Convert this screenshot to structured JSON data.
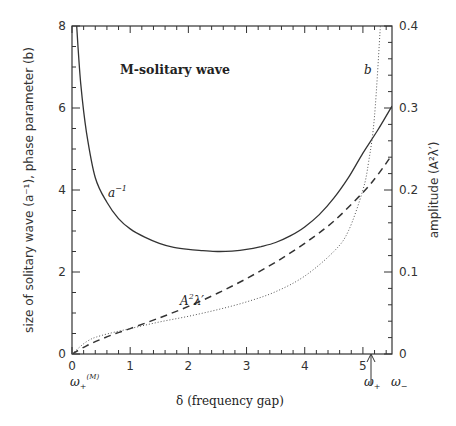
{
  "chart_data": {
    "type": "line",
    "title": "M-solitary wave",
    "xlabel": "δ (frequency gap)",
    "ylabel": "size of solitary wave (a⁻¹), phase parameter (b)",
    "y2label": "amplitude (A²λ′)",
    "xlim": [
      0,
      5.5
    ],
    "ylim": [
      0,
      8
    ],
    "y2lim": [
      0,
      0.4
    ],
    "xticks": [
      "0",
      "1",
      "2",
      "3",
      "4",
      "5"
    ],
    "yticks": [
      "0",
      "2",
      "4",
      "6",
      "8"
    ],
    "y2ticks": [
      "0",
      "0.1",
      "0.2",
      "0.3",
      "0.4"
    ],
    "grid": false,
    "legend": "inline labels",
    "annotations": [
      {
        "text": "ω₊⁽ᴹ⁾",
        "x": 0,
        "position": "below x-axis"
      },
      {
        "text": "ω₊",
        "x": 5.1,
        "position": "below x-axis with arrow"
      },
      {
        "text": "ω₋",
        "x": 5.5,
        "position": "below x-axis"
      }
    ],
    "series": [
      {
        "name": "a⁻¹",
        "style": "solid",
        "axis": "left",
        "x": [
          0.08,
          0.15,
          0.25,
          0.4,
          0.6,
          0.8,
          1.0,
          1.25,
          1.5,
          1.75,
          2.0,
          2.25,
          2.5,
          2.75,
          3.0,
          3.25,
          3.5,
          3.75,
          4.0,
          4.25,
          4.5,
          4.75,
          5.0,
          5.25,
          5.5
        ],
        "values": [
          8.0,
          6.6,
          5.4,
          4.3,
          3.7,
          3.3,
          3.05,
          2.85,
          2.7,
          2.6,
          2.55,
          2.52,
          2.5,
          2.51,
          2.55,
          2.62,
          2.72,
          2.88,
          3.1,
          3.4,
          3.8,
          4.3,
          4.9,
          5.45,
          6.05
        ]
      },
      {
        "name": "A²λ′",
        "style": "dashed",
        "axis": "right",
        "x": [
          0.0,
          0.25,
          0.5,
          0.75,
          1.0,
          1.5,
          2.0,
          2.5,
          3.0,
          3.5,
          4.0,
          4.5,
          5.0,
          5.25,
          5.5
        ],
        "values": [
          0.0,
          0.01,
          0.018,
          0.025,
          0.031,
          0.044,
          0.058,
          0.074,
          0.092,
          0.112,
          0.135,
          0.162,
          0.197,
          0.218,
          0.243
        ]
      },
      {
        "name": "b",
        "style": "dotted",
        "axis": "left",
        "x": [
          0.0,
          0.25,
          0.5,
          1.0,
          1.5,
          2.0,
          2.5,
          3.0,
          3.5,
          4.0,
          4.5,
          4.75,
          5.0,
          5.1,
          5.2,
          5.3
        ],
        "values": [
          0.0,
          0.3,
          0.45,
          0.62,
          0.78,
          0.92,
          1.08,
          1.27,
          1.52,
          1.9,
          2.5,
          3.0,
          4.0,
          4.7,
          5.8,
          8.0
        ]
      }
    ]
  },
  "labels": {
    "title": "M-solitary wave",
    "xlabel": "δ (frequency gap)",
    "ylabel": "size of solitary wave (a⁻¹), phase parameter (b)",
    "y2label": "amplitude (A²λ′)",
    "series_a": "a",
    "series_a_sup": "−1",
    "series_b": "b",
    "series_amp_A": "A",
    "series_amp_sup": "2",
    "series_amp_rest": "λ′",
    "omega_plus_M": "ω",
    "omega_plus_M_sub": "+",
    "omega_plus_M_sup": "(M)",
    "omega_plus": "ω",
    "omega_plus_sub": "+",
    "omega_minus": "ω",
    "omega_minus_sub": "−"
  }
}
